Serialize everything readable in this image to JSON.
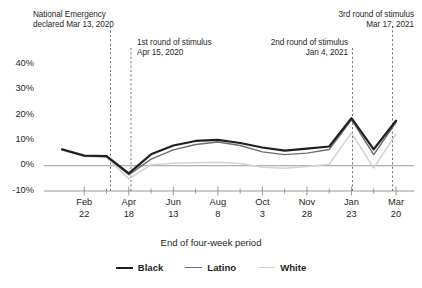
{
  "chart_data": {
    "type": "line",
    "title": "",
    "xlabel": "End of four-week period",
    "ylabel": "",
    "ylim": [
      -10,
      45
    ],
    "yticks": [
      40,
      30,
      20,
      10,
      0,
      -10
    ],
    "ytick_labels": [
      "40%",
      "30%",
      "20%",
      "10%",
      "0%",
      "-10%"
    ],
    "grid": false,
    "legend_position": "bottom",
    "x": [
      "Jan 25",
      "Feb 22",
      "Mar 21",
      "Apr 18",
      "May 16",
      "Jun 13",
      "Jul 11",
      "Aug 8",
      "Sep 5",
      "Oct 3",
      "Oct 31",
      "Nov 28",
      "Dec 26",
      "Jan 23",
      "Feb 20",
      "Mar 20"
    ],
    "xtick_labels": [
      "Feb\n22",
      "Apr\n18",
      "Jun\n13",
      "Aug\n8",
      "Oct\n3",
      "Nov\n28",
      "Jan\n23",
      "Mar\n20"
    ],
    "series": [
      {
        "name": "Black",
        "color": "#231f20",
        "width": 2.2,
        "values": [
          6.5,
          4.0,
          3.8,
          -3.0,
          4.5,
          8.0,
          9.8,
          10.2,
          9.0,
          7.2,
          6.0,
          6.8,
          7.6,
          18.8,
          6.5,
          17.8
        ]
      },
      {
        "name": "Latino",
        "color": "#6d6e71",
        "width": 1.4,
        "values": [
          6.3,
          3.9,
          3.6,
          -3.6,
          2.6,
          6.3,
          8.4,
          9.4,
          8.0,
          5.5,
          4.4,
          5.0,
          6.4,
          18.2,
          4.4,
          17.2
        ]
      },
      {
        "name": "White",
        "color": "#d2d3d4",
        "width": 1.5,
        "values": [
          6.1,
          3.7,
          3.4,
          -5.2,
          0.4,
          1.0,
          1.2,
          1.4,
          0.9,
          -0.6,
          -1.0,
          -0.3,
          0.6,
          13.0,
          -0.9,
          12.6
        ]
      }
    ],
    "annotations": [
      {
        "id": "emergency",
        "text": "National Emergency\ndeclared Mar 13, 2020",
        "x_value": "Mar 13, 2020"
      },
      {
        "id": "stimulus1",
        "text": "1st round of stimulus\nApr 15, 2020",
        "x_value": "Apr 15, 2020"
      },
      {
        "id": "stimulus2",
        "text": "2nd round of stimulus\nJan 4, 2021",
        "x_value": "Jan 4, 2021"
      },
      {
        "id": "stimulus3",
        "text": "3rd round of stimulus\nMar 17, 2021",
        "x_value": "Mar 17, 2021"
      }
    ],
    "legend": [
      "Black",
      "Latino",
      "White"
    ]
  }
}
